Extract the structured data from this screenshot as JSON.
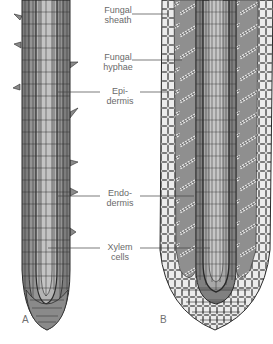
{
  "figure": {
    "panels": [
      {
        "id": "A",
        "letter": "A"
      },
      {
        "id": "B",
        "letter": "B"
      }
    ],
    "labels": [
      {
        "id": "fungal-sheath",
        "line1": "Fungal",
        "line2": "sheath"
      },
      {
        "id": "fungal-hyphae",
        "line1": "Fungal",
        "line2": "hyphae"
      },
      {
        "id": "epidermis",
        "line1": "Epi-",
        "line2": "dermis"
      },
      {
        "id": "endodermis",
        "line1": "Endo-",
        "line2": "dermis"
      },
      {
        "id": "xylem-cells",
        "line1": "Xylem",
        "line2": "cells"
      }
    ],
    "colors": {
      "outline": "#2a2a2a",
      "cortex_dark": "#7d7d7d",
      "cortex_mid": "#9a9a9a",
      "stele_light": "#b8b8b8",
      "sheath_light": "#e8e8e8",
      "label_text": "#6a6a6a"
    }
  }
}
